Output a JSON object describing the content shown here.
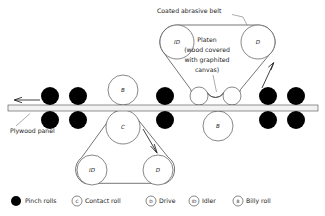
{
  "figure": {
    "type": "mechanical-diagram",
    "background_color": "#ffffff",
    "ink_color": "#1a1a1a",
    "pinch_roll_color": "#000000",
    "panel_color": "#f2f2f2"
  },
  "annotations": {
    "belt_label": "Coated abrasive belt",
    "platen_label_lines": [
      "Platen",
      "(wood covered",
      "with graphited",
      "canvas)"
    ],
    "panel_label": "Plywood panel"
  },
  "rolls": {
    "upper_assembly": [
      {
        "code": "ID",
        "name": "idler",
        "cx": 177,
        "cy": 42,
        "r": 17
      },
      {
        "code": "D",
        "name": "drive",
        "cx": 258,
        "cy": 42,
        "r": 17
      },
      {
        "code": "",
        "name": "platen-roller-left",
        "cx": 199,
        "cy": 96,
        "r": 9
      },
      {
        "code": "",
        "name": "platen-roller-right",
        "cx": 232,
        "cy": 96,
        "r": 9
      }
    ],
    "lower_assembly": [
      {
        "code": "C",
        "name": "contact-roll",
        "cx": 123,
        "cy": 127,
        "r": 17
      },
      {
        "code": "ID",
        "name": "idler",
        "cx": 92,
        "cy": 170,
        "r": 15
      },
      {
        "code": "D",
        "name": "drive",
        "cx": 158,
        "cy": 170,
        "r": 15
      }
    ],
    "billy_rolls": [
      {
        "code": "B",
        "name": "billy-roll-upper",
        "cx": 123,
        "cy": 90,
        "r": 15
      },
      {
        "code": "B",
        "name": "billy-roll-lower",
        "cx": 218,
        "cy": 126,
        "r": 15
      }
    ],
    "pinch_roll_pairs_x": [
      50,
      78,
      165,
      268,
      296
    ],
    "pinch_roll_radius": 9,
    "pinch_roll_upper_cy": 96,
    "pinch_roll_lower_cy": 120
  },
  "panel": {
    "x": 8,
    "y": 105,
    "width": 310,
    "height": 6
  },
  "feed_arrow": {
    "direction": "left",
    "from_x": 40,
    "to_x": 14,
    "y": 100
  },
  "legend": [
    {
      "symbol": "filled-circle",
      "code": "",
      "label": "Pinch rolls"
    },
    {
      "symbol": "circle",
      "code": "C",
      "label": "Contact roll"
    },
    {
      "symbol": "circle",
      "code": "D",
      "label": "Drive"
    },
    {
      "symbol": "circle",
      "code": "ID",
      "label": "Idler"
    },
    {
      "symbol": "circle",
      "code": "B",
      "label": "Billy roll"
    }
  ]
}
